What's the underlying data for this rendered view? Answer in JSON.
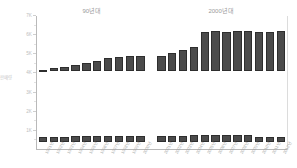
{
  "chart_data": {
    "type": "bar",
    "title": "",
    "xlabel": "",
    "ylabel": "판매량",
    "ylim": [
      0,
      7000
    ],
    "grid": false,
    "legend_position": "none",
    "group_headers": [
      {
        "label": "90년대",
        "start_index": 0,
        "end_index": 9
      },
      {
        "label": "2000년대",
        "start_index": 10,
        "end_index": 21
      }
    ],
    "categories": [
      "1991년",
      "1992년",
      "1993년",
      "1994년",
      "1995년",
      "1996년",
      "1997년",
      "1998년",
      "1999년",
      "2000년",
      "2001년",
      "2002년",
      "2003년",
      "2004년",
      "2005년",
      "2006년",
      "2007년",
      "2008년",
      "2009년",
      "2010년",
      "2011년",
      "2012년"
    ],
    "series": [
      {
        "name": "상단 막대",
        "values": [
          60,
          150,
          240,
          330,
          430,
          560,
          700,
          760,
          800,
          790,
          810,
          950,
          1150,
          1300,
          2100,
          2150,
          2120,
          2160,
          2140,
          2130,
          2110,
          2140
        ]
      },
      {
        "name": "하단 막대",
        "values": [
          170,
          180,
          180,
          185,
          190,
          195,
          200,
          200,
          205,
          200,
          210,
          215,
          215,
          220,
          230,
          235,
          235,
          230,
          225,
          180,
          160,
          170
        ]
      }
    ],
    "yticks": [
      {
        "value": 7000,
        "label": "7K"
      },
      {
        "value": 6000,
        "label": "6K"
      },
      {
        "value": 5000,
        "label": "5K"
      },
      {
        "value": 4000,
        "label": "4K"
      },
      {
        "value": 3000,
        "label": "3K"
      },
      {
        "value": 2000,
        "label": "2K"
      },
      {
        "value": 1000,
        "label": "1K"
      }
    ],
    "colors": {
      "bar_fill": "#4b4b4b",
      "bar_stroke": "#2e2e2e",
      "axis": "#b9b9b9",
      "tick_text": "#c9c9c9",
      "header_text": "#9a9a9a",
      "xlabel_text": "#a8a8a8",
      "background": "#ffffff"
    }
  }
}
